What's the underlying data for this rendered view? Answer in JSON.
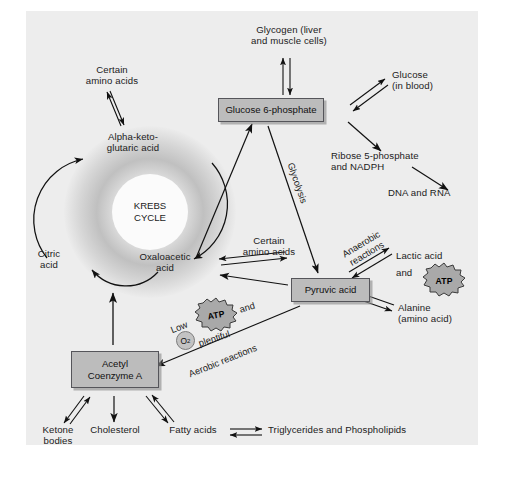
{
  "diagram": {
    "background_color": "#ededed",
    "box_fill": "#bcbcbc",
    "box_border": "#55555a",
    "line_color": "#111111"
  },
  "cycle": {
    "center_label": "KREBS\nCYCLE",
    "intermediates": [
      {
        "name": "alpha-ketoglutaric-acid",
        "label": "Alpha-keto-\nglutaric acid"
      },
      {
        "name": "citric-acid",
        "label": "Citric\nacid"
      },
      {
        "name": "oxaloacetic-acid",
        "label": "Oxaloacetic\nacid"
      }
    ]
  },
  "boxes": [
    {
      "name": "glucose-6-phosphate",
      "label": "Glucose 6-phosphate"
    },
    {
      "name": "pyruvic-acid",
      "label": "Pyruvic acid"
    },
    {
      "name": "acetyl-coenzyme-a",
      "label": "Acetyl\nCoenzyme A"
    }
  ],
  "labels": {
    "certain_amino_acids_top": "Certain\namino acids",
    "certain_amino_acids_mid": "Certain\namino acids",
    "glycogen": "Glycogen (liver\nand muscle cells)",
    "glucose_blood": "Glucose\n(in blood)",
    "ribose_nadph": "Ribose 5-phosphate\nand NADPH",
    "dna_rna": "DNA and RNA",
    "lactic_acid": "Lactic acid",
    "lactic_acid_and": "and",
    "alanine": "Alanine\n(amino acid)",
    "ketone_bodies": "Ketone\nbodies",
    "cholesterol": "Cholesterol",
    "fatty_acids": "Fatty acids",
    "triglycerides": "Triglycerides and Phospholipids",
    "acetyl_box": "Acetyl\nCoenzyme A"
  },
  "pathway_labels": {
    "glycolysis": "Glycolysis",
    "anaerobic": "Anaerobic\nreactions",
    "aerobic": "Aerobic reactions"
  },
  "condition_note": {
    "low_word": "Low",
    "and_word": "and",
    "plentiful_word": "plentiful",
    "atp_label": "ATP",
    "o2_label": "O",
    "o2_sub": "2"
  },
  "badges": {
    "atp_lactic": "ATP",
    "atp_condition": "ATP"
  }
}
